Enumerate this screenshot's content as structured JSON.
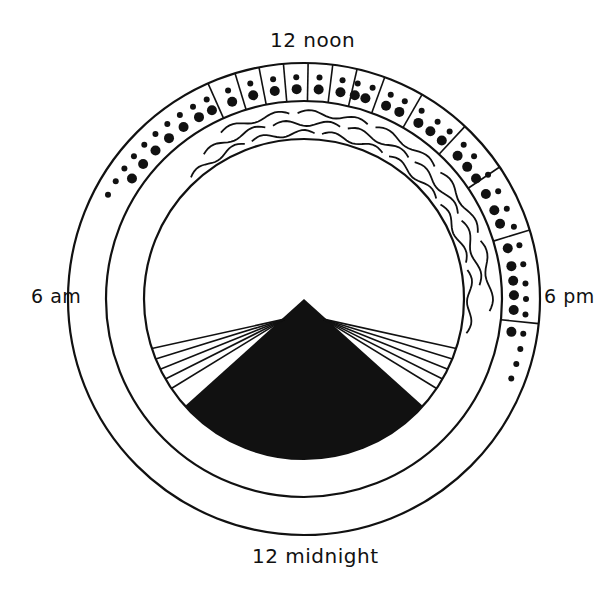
{
  "labels": {
    "top": "12 noon",
    "left": "6 am",
    "right": "6 pm",
    "bottom": "12 midnight"
  },
  "colors": {
    "ink": "#111111",
    "background": "#ffffff"
  },
  "geometry": {
    "center": [
      304,
      299
    ],
    "outer_radius": 236,
    "middle_radius": 198,
    "inner_radius": 160,
    "hour_degrees": 15,
    "angle_zero": "12 noon at top, clockwise"
  },
  "dotted_band": {
    "description": "Outer ring: dotted band (larger dots inner row, smaller dots outer row), boxed segments from ~10:30am to ~7pm",
    "start_angle": -153,
    "end_angle": 22,
    "segment_dividers_deg": [
      -114,
      -107,
      -101,
      -95,
      -89,
      -83,
      -77,
      -70,
      -60,
      -47,
      -34,
      -17,
      6
    ],
    "inner_dots_deg": [
      -145,
      -140,
      -135,
      -130,
      -125,
      -120,
      -116,
      -110,
      -104,
      -98,
      -92,
      -86,
      -80,
      -76,
      -73,
      -67,
      -63,
      -57,
      -53,
      -49,
      -43,
      -39,
      -35,
      -30,
      -25,
      -21,
      -14,
      -9,
      -5,
      -1,
      3,
      9
    ],
    "outer_dots_deg": [
      -152,
      -148,
      -144,
      -140,
      -136,
      -132,
      -128,
      -124,
      -120,
      -116,
      -110,
      -104,
      -98,
      -92,
      -86,
      -80,
      -76,
      -72,
      -67,
      -63,
      -58,
      -53,
      -49,
      -44,
      -40,
      -34,
      -29,
      -24,
      -19,
      -14,
      -9,
      -4,
      0,
      4,
      9,
      13,
      17,
      21
    ]
  },
  "wavy_band": {
    "description": "Middle ring: wavy lines between middle and inner circle, from ~11am to ~6pm",
    "start_angle": -126,
    "end_angle": 5,
    "wave_count": 16
  },
  "night_cone": {
    "description": "Black sector in inner circle from center down, fringed by radiating lines",
    "apex": [
      304,
      299
    ],
    "left_edge_deg": 138,
    "right_edge_deg": 42,
    "left_fringe_deg": [
      146,
      150,
      154,
      158,
      162
    ],
    "right_fringe_deg": [
      18,
      22,
      26,
      30,
      34
    ]
  }
}
